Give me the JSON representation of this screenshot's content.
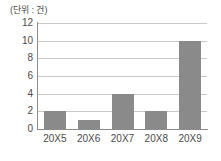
{
  "chart_data": {
    "type": "bar",
    "title": "",
    "unit_label": "(단위 : 건)",
    "categories": [
      "20X5",
      "20X6",
      "20X7",
      "20X8",
      "20X9"
    ],
    "values": [
      2,
      1,
      4,
      2,
      10
    ],
    "xlabel": "",
    "ylabel": "",
    "ylim": [
      0,
      12
    ],
    "ytick_labels": [
      "12",
      "10",
      "8",
      "6",
      "4",
      "2",
      "0"
    ],
    "ytick_values": [
      12,
      10,
      8,
      6,
      4,
      2,
      0
    ],
    "ytick_step": 2,
    "grid": true,
    "grid_axis": "y",
    "legend": false,
    "legend_position": "none",
    "colors": {
      "bar": "#8a8a8a",
      "gridline": "#c9c9c9",
      "axis": "#8c8c8c",
      "text": "#4a4a4a",
      "background": "#ffffff"
    }
  }
}
